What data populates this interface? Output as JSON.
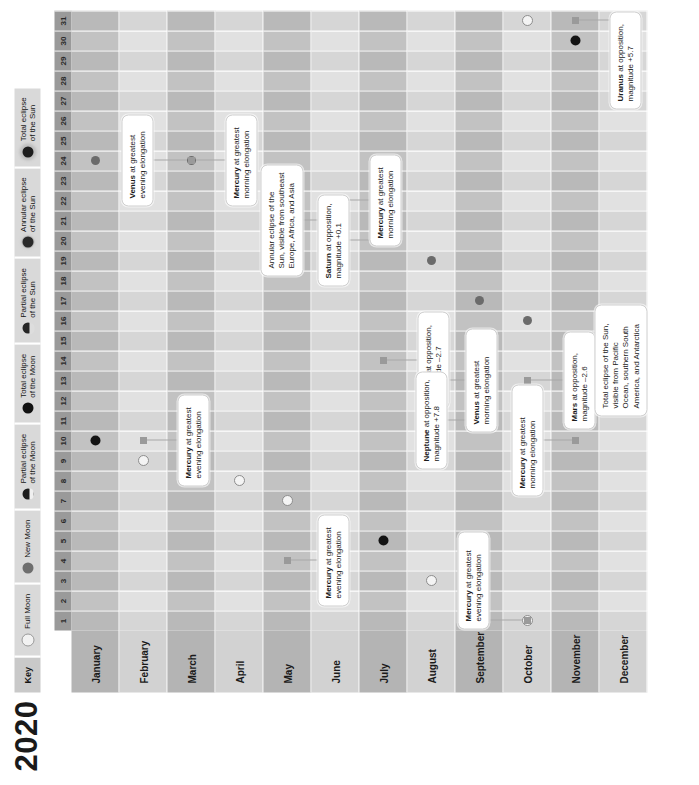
{
  "title": "2020",
  "legend": {
    "key_label": "Key",
    "items": [
      {
        "glyph": "full-moon-icon",
        "label": "Full Moon"
      },
      {
        "glyph": "new-moon-icon",
        "label": "New Moon"
      },
      {
        "glyph": "partial-lunar-eclipse-icon",
        "label": "Partial eclipse\nof the Moon"
      },
      {
        "glyph": "total-lunar-eclipse-icon",
        "label": "Total eclipse\nof the Moon"
      },
      {
        "glyph": "partial-solar-eclipse-icon",
        "label": "Partial eclipse\nof the Sun"
      },
      {
        "glyph": "annular-solar-eclipse-icon",
        "label": "Annular eclipse\nof the Sun"
      },
      {
        "glyph": "total-solar-eclipse-icon",
        "label": "Total eclipse\nof the Sun"
      }
    ]
  },
  "days": [
    "1",
    "2",
    "3",
    "4",
    "5",
    "6",
    "7",
    "8",
    "9",
    "10",
    "11",
    "12",
    "13",
    "14",
    "15",
    "16",
    "17",
    "18",
    "19",
    "20",
    "21",
    "22",
    "23",
    "24",
    "25",
    "26",
    "27",
    "28",
    "29",
    "30",
    "31"
  ],
  "months": [
    {
      "name": "January"
    },
    {
      "name": "February"
    },
    {
      "name": "March"
    },
    {
      "name": "April"
    },
    {
      "name": "May"
    },
    {
      "name": "June"
    },
    {
      "name": "July"
    },
    {
      "name": "August"
    },
    {
      "name": "September"
    },
    {
      "name": "October"
    },
    {
      "name": "November"
    },
    {
      "name": "December"
    }
  ],
  "chart_data": {
    "type": "table",
    "title": "2020",
    "xlabel": "Day of month",
    "ylabel": "Month",
    "xlim": [
      1,
      31
    ],
    "markers": [
      {
        "month": 1,
        "day": 10,
        "type": "partial-lunar-eclipse-icon"
      },
      {
        "month": 1,
        "day": 24,
        "type": "new-moon-icon"
      },
      {
        "month": 2,
        "day": 9,
        "type": "full-moon-icon"
      },
      {
        "month": 2,
        "day": 23,
        "type": "new-moon-icon"
      },
      {
        "month": 3,
        "day": 9,
        "type": "full-moon-icon"
      },
      {
        "month": 3,
        "day": 24,
        "type": "new-moon-icon"
      },
      {
        "month": 4,
        "day": 8,
        "type": "full-moon-icon"
      },
      {
        "month": 4,
        "day": 23,
        "type": "new-moon-icon"
      },
      {
        "month": 5,
        "day": 7,
        "type": "full-moon-icon"
      },
      {
        "month": 5,
        "day": 22,
        "type": "new-moon-icon"
      },
      {
        "month": 6,
        "day": 5,
        "type": "partial-lunar-eclipse-icon"
      },
      {
        "month": 6,
        "day": 21,
        "type": "annular-solar-eclipse-icon"
      },
      {
        "month": 7,
        "day": 5,
        "type": "partial-lunar-eclipse-icon"
      },
      {
        "month": 7,
        "day": 20,
        "type": "new-moon-icon"
      },
      {
        "month": 8,
        "day": 3,
        "type": "full-moon-icon"
      },
      {
        "month": 8,
        "day": 19,
        "type": "new-moon-icon"
      },
      {
        "month": 9,
        "day": 2,
        "type": "full-moon-icon"
      },
      {
        "month": 9,
        "day": 17,
        "type": "new-moon-icon"
      },
      {
        "month": 10,
        "day": 1,
        "type": "full-moon-icon"
      },
      {
        "month": 10,
        "day": 16,
        "type": "new-moon-icon"
      },
      {
        "month": 10,
        "day": 31,
        "type": "full-moon-icon"
      },
      {
        "month": 11,
        "day": 15,
        "type": "new-moon-icon"
      },
      {
        "month": 11,
        "day": 30,
        "type": "partial-lunar-eclipse-icon"
      },
      {
        "month": 12,
        "day": 14,
        "type": "total-solar-eclipse-icon"
      },
      {
        "month": 12,
        "day": 14,
        "type": "new-moon-icon"
      },
      {
        "month": 12,
        "day": 30,
        "type": "full-moon-icon"
      }
    ],
    "events": [
      {
        "month": 2,
        "day": 10,
        "lines": [
          "Mercury at greatest",
          "evening elongation"
        ],
        "bold": "Mercury"
      },
      {
        "month": 3,
        "day": 24,
        "lines": [
          "Venus at greatest",
          "evening elongation"
        ],
        "bold": "Venus"
      },
      {
        "month": 3,
        "day": 24,
        "lines": [
          "Mercury at greatest",
          "morning elongation"
        ],
        "bold": "Mercury"
      },
      {
        "month": 5,
        "day": 4,
        "lines": [
          "Mercury at greatest",
          "evening elongation"
        ],
        "bold": "Mercury"
      },
      {
        "month": 6,
        "day": 21,
        "lines": [
          "Annular eclipse of the",
          "Sun, visible from southeast",
          "Europe, Africa, and Asia"
        ],
        "bold": ""
      },
      {
        "month": 6,
        "day": 22,
        "lines": [
          "Mercury at greatest",
          "morning elongation"
        ],
        "bold": "Mercury"
      },
      {
        "month": 7,
        "day": 20,
        "lines": [
          "Saturn at opposition,",
          "magnitude +0.1"
        ],
        "bold": "Saturn"
      },
      {
        "month": 7,
        "day": 14,
        "lines": [
          "Jupiter at opposition,",
          "magnitude –2.7"
        ],
        "bold": "Jupiter"
      },
      {
        "month": 8,
        "day": 13,
        "lines": [
          "Venus at greatest",
          "morning elongation"
        ],
        "bold": "Venus"
      },
      {
        "month": 9,
        "day": 11,
        "lines": [
          "Neptune at opposition,",
          "magnitude +7.8"
        ],
        "bold": "Neptune"
      },
      {
        "month": 10,
        "day": 13,
        "lines": [
          "Mars at opposition,",
          "magnitude –2.6"
        ],
        "bold": "Mars"
      },
      {
        "month": 10,
        "day": 1,
        "lines": [
          "Mercury at greatest",
          "evening elongation"
        ],
        "bold": "Mercury"
      },
      {
        "month": 11,
        "day": 31,
        "lines": [
          "Uranus at opposition,",
          "magnitude +5.7"
        ],
        "bold": "Uranus"
      },
      {
        "month": 11,
        "day": 10,
        "lines": [
          "Mercury at greatest",
          "morning elongation"
        ],
        "bold": "Mercury"
      },
      {
        "month": 12,
        "day": 14,
        "lines": [
          "Total eclipse of the Sun,",
          "visible from Pacific",
          "Ocean, southern South",
          "America, and Antarctica"
        ],
        "bold": ""
      }
    ]
  }
}
